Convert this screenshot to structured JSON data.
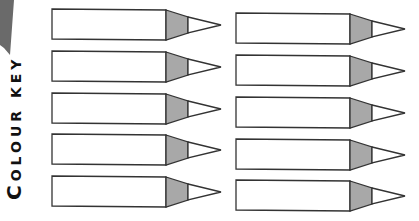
{
  "worksheet": {
    "title_first": "C",
    "title_rest": "OLOUR KEY",
    "pencil_count": 10,
    "colors": {
      "outline": "#333333",
      "wood_shade": "#a8a8a8",
      "body": "#ffffff",
      "corner_shape": "#6a6a6a"
    },
    "left_column": [
      {
        "label": ""
      },
      {
        "label": ""
      },
      {
        "label": ""
      },
      {
        "label": ""
      },
      {
        "label": ""
      }
    ],
    "right_column": [
      {
        "label": ""
      },
      {
        "label": ""
      },
      {
        "label": ""
      },
      {
        "label": ""
      },
      {
        "label": ""
      }
    ]
  }
}
